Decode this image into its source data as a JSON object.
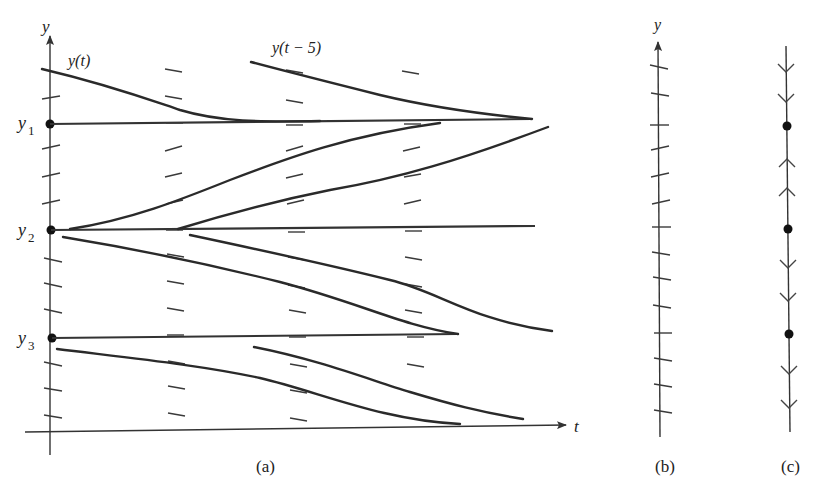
{
  "figure": {
    "panel_a": {
      "caption": "(a)",
      "y_axis_label": "y",
      "t_axis_label": "t",
      "equilibrium_labels": {
        "y1": "y",
        "y1_sub": "1",
        "y2": "y",
        "y2_sub": "2",
        "y3": "y",
        "y3_sub": "3"
      },
      "curve_label_left": "y(t)",
      "curve_label_shifted": "y(t − 5)"
    },
    "panel_b": {
      "caption": "(b)",
      "axis_label": "y"
    },
    "panel_c": {
      "caption": "(c)"
    }
  },
  "colors": {
    "ink": "#2a2a2a",
    "background": "#ffffff"
  }
}
